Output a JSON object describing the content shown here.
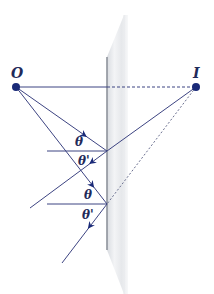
{
  "diagram": {
    "colors": {
      "ray": "#3d4482",
      "point": "#1a2a78",
      "mirror_light": "#f4f5f7",
      "mirror_mid": "#dfe1e5",
      "mirror_edge": "#8e939c",
      "label": "#1f2a5a"
    },
    "points": {
      "object": {
        "label": "O",
        "x": 16,
        "y": 87
      },
      "image": {
        "label": "I",
        "x": 196,
        "y": 87
      }
    },
    "angle_labels": [
      {
        "text": "θ",
        "x": 75,
        "y": 146
      },
      {
        "text": "θ'",
        "x": 80,
        "y": 165
      },
      {
        "text": "θ",
        "x": 84,
        "y": 199
      },
      {
        "text": "θ'",
        "x": 84,
        "y": 219
      }
    ]
  }
}
